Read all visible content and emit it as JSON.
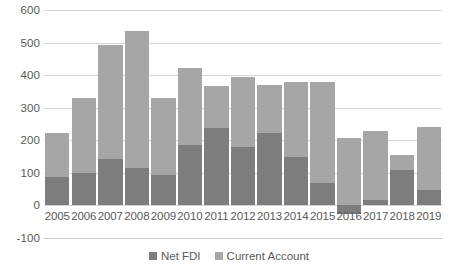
{
  "chart_data": {
    "type": "bar",
    "subtype": "stacked-column",
    "title": "",
    "xlabel": "",
    "ylabel": "",
    "categories": [
      "2005",
      "2006",
      "2007",
      "2008",
      "2009",
      "2010",
      "2011",
      "2012",
      "2013",
      "2014",
      "2015",
      "2016",
      "2017",
      "2018",
      "2019"
    ],
    "series": [
      {
        "name": "Net FDI",
        "color": "#7d7d7d",
        "values": [
          88,
          100,
          143,
          115,
          92,
          187,
          237,
          180,
          222,
          150,
          68,
          -25,
          18,
          110,
          48
        ]
      },
      {
        "name": "Current Account",
        "color": "#a6a6a6",
        "values": [
          134,
          230,
          350,
          422,
          238,
          236,
          131,
          215,
          148,
          230,
          310,
          207,
          210,
          45,
          192
        ]
      }
    ],
    "totals": [
      222,
      330,
      493,
      537,
      330,
      423,
      368,
      395,
      370,
      380,
      378,
      207,
      228,
      155,
      240
    ],
    "ylim": [
      -100,
      600
    ],
    "ytick_values": [
      600,
      500,
      400,
      300,
      200,
      100,
      0,
      -100
    ],
    "ytick_labels": [
      "600",
      "500",
      "400",
      "300",
      "200",
      "100",
      "0",
      "-100"
    ],
    "grid": true,
    "grid_axis": "y",
    "legend_position": "bottom",
    "legend": [
      "Net FDI",
      "Current Account"
    ]
  },
  "colors": {
    "net_fdi": "#7d7d7d",
    "current_account": "#a6a6a6",
    "gridline": "#d4d4d4",
    "text": "#595959",
    "background": "#ffffff"
  }
}
